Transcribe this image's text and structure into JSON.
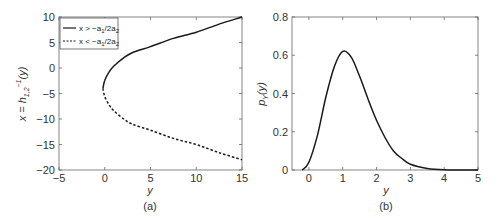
{
  "chart_data": [
    {
      "panel": "(a)",
      "type": "line",
      "title": "",
      "xlabel": "y",
      "ylabel": "x = h_{1,2}^{-1}(y)",
      "xlim": [
        -5,
        15
      ],
      "ylim": [
        -20,
        10
      ],
      "xticks": [
        "-5",
        "0",
        "5",
        "10",
        "15"
      ],
      "yticks": [
        "10",
        "5",
        "0",
        "-5",
        "-10",
        "-15",
        "-20"
      ],
      "grid": false,
      "legend_position": "upper left",
      "series": [
        {
          "name": "x > -a1/2a2",
          "style": "solid",
          "x": [
            -0.2,
            0,
            0.5,
            1,
            2,
            3,
            5,
            7.5,
            10,
            12.5,
            15
          ],
          "y": [
            -4,
            -2.4,
            -0.7,
            0.4,
            1.9,
            3.0,
            4.2,
            5.8,
            7.0,
            8.6,
            10.0
          ]
        },
        {
          "name": "x < -a1/2a2",
          "style": "dashed",
          "x": [
            -0.2,
            0,
            0.5,
            1,
            2,
            3,
            5,
            7.5,
            10,
            12.5,
            15
          ],
          "y": [
            -4,
            -5.6,
            -7.3,
            -8.4,
            -9.9,
            -11.0,
            -12.2,
            -13.8,
            -15.0,
            -16.6,
            -18.0
          ]
        }
      ]
    },
    {
      "panel": "(b)",
      "type": "line",
      "title": "",
      "xlabel": "y",
      "ylabel": "p_Y(y)",
      "xlim": [
        -0.5,
        5
      ],
      "ylim": [
        0,
        0.8
      ],
      "xticks": [
        "0",
        "1",
        "2",
        "3",
        "4",
        "5"
      ],
      "yticks": [
        "0.8",
        "0.6",
        "0.4",
        "0.2",
        "0"
      ],
      "grid": false,
      "series": [
        {
          "name": "p_Y(y)",
          "style": "solid",
          "x": [
            -0.2,
            0,
            0.25,
            0.5,
            0.75,
            1.0,
            1.25,
            1.5,
            1.75,
            2.0,
            2.25,
            2.5,
            2.75,
            3.0,
            3.5,
            4.0,
            4.5,
            5.0
          ],
          "y": [
            0.0,
            0.04,
            0.18,
            0.38,
            0.54,
            0.62,
            0.59,
            0.49,
            0.37,
            0.26,
            0.17,
            0.1,
            0.06,
            0.03,
            0.008,
            0.001,
            0.0,
            0.0
          ]
        }
      ]
    }
  ],
  "panels": {
    "a": {
      "caption": "(a)",
      "xlabel": "y",
      "ylabel_main": "x = h",
      "ylabel_sub": "1,2",
      "ylabel_sup": "−1",
      "ylabel_tail": "(y)",
      "legend": [
        {
          "pre": "x > −a",
          "s1": "1",
          "mid": "/2a",
          "s2": "2"
        },
        {
          "pre": "x < −a",
          "s1": "1",
          "mid": "/2a",
          "s2": "2"
        }
      ]
    },
    "b": {
      "caption": "(b)",
      "xlabel": "y",
      "ylabel_main": "p",
      "ylabel_sub": "Y",
      "ylabel_tail": "(y)"
    }
  },
  "colors": {
    "line": "#1a1a1a",
    "axis": "#555555",
    "text": "#333333"
  }
}
